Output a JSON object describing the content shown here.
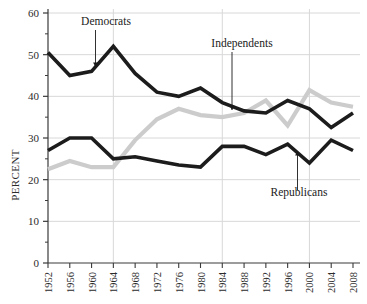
{
  "chart_data": {
    "type": "line",
    "title": "",
    "xlabel": "",
    "ylabel": "PERCENT",
    "ylim": [
      0,
      60
    ],
    "yticks": [
      0,
      10,
      20,
      30,
      40,
      50,
      60
    ],
    "ytick_labels": [
      "0",
      "10",
      "20",
      "30",
      "40",
      "50",
      "60"
    ],
    "grid": "horizontal-and-vertical-major",
    "gridlines_y": [
      10,
      20,
      30,
      40,
      50,
      60
    ],
    "gridlines_x": [
      1964,
      1984,
      2000
    ],
    "legend": "annotations",
    "x": [
      1952,
      1956,
      1960,
      1964,
      1968,
      1972,
      1976,
      1980,
      1984,
      1988,
      1992,
      1996,
      2000,
      2004,
      2008
    ],
    "xtick_labels": [
      "1952",
      "1956",
      "1960",
      "1964",
      "1968",
      "1972",
      "1976",
      "1980",
      "1984",
      "1988",
      "1992",
      "1996",
      "2000",
      "2004",
      "2008"
    ],
    "series": [
      {
        "name": "Democrats",
        "color": "#1c1c1c",
        "values": [
          50.5,
          45.0,
          46.0,
          52.0,
          45.5,
          41.0,
          40.0,
          42.0,
          38.5,
          36.5,
          36.0,
          39.0,
          37.0,
          32.5,
          36.0
        ]
      },
      {
        "name": "Independents",
        "color": "#cccccc",
        "values": [
          22.5,
          24.5,
          23.0,
          23.0,
          29.5,
          34.5,
          37.0,
          35.5,
          35.0,
          36.0,
          39.0,
          33.0,
          41.5,
          38.5,
          37.5
        ]
      },
      {
        "name": "Republicans",
        "color": "#1c1c1c",
        "values": [
          27.0,
          30.0,
          30.0,
          25.0,
          25.5,
          24.5,
          23.5,
          23.0,
          28.0,
          28.0,
          26.0,
          28.5,
          24.0,
          29.5,
          27.0
        ]
      }
    ],
    "annotations": [
      {
        "label": "Democrats",
        "points_to_year": 1959,
        "points_to_value": 46.0
      },
      {
        "label": "Independents",
        "points_to_year": 1983,
        "points_to_value": 35.5
      },
      {
        "label": "Republicans",
        "points_to_year": 1995,
        "points_to_value": 27.0
      }
    ]
  }
}
